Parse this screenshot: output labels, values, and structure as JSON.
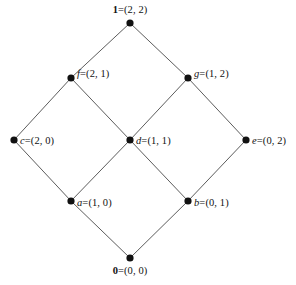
{
  "diagram": {
    "kind": "hasse-diagram",
    "title": "",
    "background_color": "#ffffff",
    "edge_color": "#4a4a4a",
    "node_color": "#111111",
    "node_radius": 3.6,
    "nodes": [
      {
        "id": "top",
        "name": "1",
        "name_bold": true,
        "value": "=(2, 2)",
        "full_label": "1=(2, 2)",
        "x": 130,
        "y": 23,
        "label_x": 130,
        "label_y": 5,
        "label_pos": "above-center"
      },
      {
        "id": "f",
        "name": "f",
        "name_bold": false,
        "value": "=(2, 1)",
        "full_label": "f=(2, 1)",
        "x": 71,
        "y": 78,
        "label_x": 77,
        "label_y": 74,
        "label_pos": "right"
      },
      {
        "id": "g",
        "name": "g",
        "name_bold": false,
        "value": "=(1, 2)",
        "full_label": "g=(1, 2)",
        "x": 188,
        "y": 78,
        "label_x": 194,
        "label_y": 74,
        "label_pos": "right"
      },
      {
        "id": "c",
        "name": "c",
        "name_bold": false,
        "value": "=(2, 0)",
        "full_label": "c=(2, 0)",
        "x": 14,
        "y": 140,
        "label_x": 20,
        "label_y": 141,
        "label_pos": "right"
      },
      {
        "id": "d",
        "name": "d",
        "name_bold": false,
        "value": "=(1, 1)",
        "full_label": "d=(1, 1)",
        "x": 130,
        "y": 140,
        "label_x": 136,
        "label_y": 141,
        "label_pos": "right"
      },
      {
        "id": "e",
        "name": "e",
        "name_bold": false,
        "value": "=(0, 2)",
        "full_label": "e=(0, 2)",
        "x": 246,
        "y": 140,
        "label_x": 252,
        "label_y": 141,
        "label_pos": "right"
      },
      {
        "id": "a",
        "name": "a",
        "name_bold": false,
        "value": "=(1, 0)",
        "full_label": "a=(1, 0)",
        "x": 71,
        "y": 201,
        "label_x": 77,
        "label_y": 203,
        "label_pos": "right"
      },
      {
        "id": "b",
        "name": "b",
        "name_bold": false,
        "value": "=(0, 1)",
        "full_label": "b=(0, 1)",
        "x": 188,
        "y": 201,
        "label_x": 194,
        "label_y": 203,
        "label_pos": "right"
      },
      {
        "id": "bottom",
        "name": "0",
        "name_bold": true,
        "value": "=(0, 0)",
        "full_label": "0=(0, 0)",
        "x": 130,
        "y": 258,
        "label_x": 130,
        "label_y": 266,
        "label_pos": "below-center"
      }
    ],
    "edges": [
      {
        "id": "edge-top-f",
        "from": "top",
        "to": "f",
        "x1": 130,
        "y1": 23,
        "x2": 71,
        "y2": 78
      },
      {
        "id": "edge-top-g",
        "from": "top",
        "to": "g",
        "x1": 130,
        "y1": 23,
        "x2": 188,
        "y2": 78
      },
      {
        "id": "edge-f-c",
        "from": "f",
        "to": "c",
        "x1": 71,
        "y1": 78,
        "x2": 14,
        "y2": 140
      },
      {
        "id": "edge-f-d",
        "from": "f",
        "to": "d",
        "x1": 71,
        "y1": 78,
        "x2": 130,
        "y2": 140
      },
      {
        "id": "edge-g-d",
        "from": "g",
        "to": "d",
        "x1": 188,
        "y1": 78,
        "x2": 130,
        "y2": 140
      },
      {
        "id": "edge-g-e",
        "from": "g",
        "to": "e",
        "x1": 188,
        "y1": 78,
        "x2": 246,
        "y2": 140
      },
      {
        "id": "edge-c-a",
        "from": "c",
        "to": "a",
        "x1": 14,
        "y1": 140,
        "x2": 71,
        "y2": 201
      },
      {
        "id": "edge-d-a",
        "from": "d",
        "to": "a",
        "x1": 130,
        "y1": 140,
        "x2": 71,
        "y2": 201
      },
      {
        "id": "edge-d-b",
        "from": "d",
        "to": "b",
        "x1": 130,
        "y1": 140,
        "x2": 188,
        "y2": 201
      },
      {
        "id": "edge-e-b",
        "from": "e",
        "to": "b",
        "x1": 246,
        "y1": 140,
        "x2": 188,
        "y2": 201
      },
      {
        "id": "edge-a-bottom",
        "from": "a",
        "to": "bottom",
        "x1": 71,
        "y1": 201,
        "x2": 130,
        "y2": 258
      },
      {
        "id": "edge-b-bottom",
        "from": "b",
        "to": "bottom",
        "x1": 188,
        "y1": 201,
        "x2": 130,
        "y2": 258
      }
    ]
  }
}
